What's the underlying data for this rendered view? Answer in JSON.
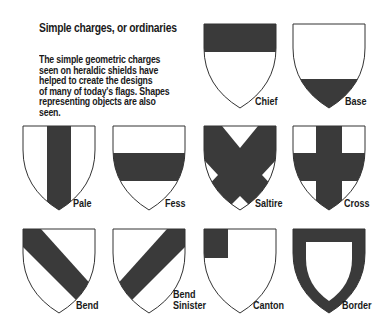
{
  "heading": "Simple charges, or ordinaries",
  "description_lines": [
    "The simple geometric charges",
    "seen on heraldic shields have",
    "helped to create the designs",
    "of many of today's flags. Shapes",
    "representing objects are also",
    "seen."
  ],
  "colors": {
    "charge": "#3a3a3a",
    "field": "#ffffff",
    "outline": "#333333"
  },
  "shields": [
    {
      "name": "Chief",
      "icon": "shield-chief-icon"
    },
    {
      "name": "Base",
      "icon": "shield-base-icon"
    },
    {
      "name": "Pale",
      "icon": "shield-pale-icon"
    },
    {
      "name": "Fess",
      "icon": "shield-fess-icon"
    },
    {
      "name": "Saltire",
      "icon": "shield-saltire-icon"
    },
    {
      "name": "Cross",
      "icon": "shield-cross-icon"
    },
    {
      "name": "Bend",
      "icon": "shield-bend-icon"
    },
    {
      "name": "Bend Sinister",
      "label_lines": [
        "Bend",
        "Sinister"
      ],
      "icon": "shield-bend-sinister-icon"
    },
    {
      "name": "Canton",
      "icon": "shield-canton-icon"
    },
    {
      "name": "Border",
      "icon": "shield-border-icon"
    }
  ]
}
